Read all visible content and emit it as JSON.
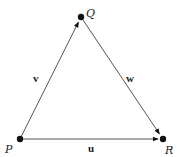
{
  "diagram": {
    "type": "vector-triangle",
    "colors": {
      "line": "#555555",
      "point": "#111111",
      "text": "#1a1a1a",
      "background": "#ffffff"
    },
    "points": {
      "P": {
        "label": "P",
        "x": 20,
        "y": 139
      },
      "Q": {
        "label": "Q",
        "x": 81,
        "y": 17
      },
      "R": {
        "label": "R",
        "x": 163,
        "y": 139
      }
    },
    "vectors": [
      {
        "name": "v",
        "label": "v",
        "from": "P",
        "to": "Q"
      },
      {
        "name": "w",
        "label": "w",
        "from": "Q",
        "to": "R"
      },
      {
        "name": "u",
        "label": "u",
        "from": "P",
        "to": "R"
      }
    ]
  }
}
